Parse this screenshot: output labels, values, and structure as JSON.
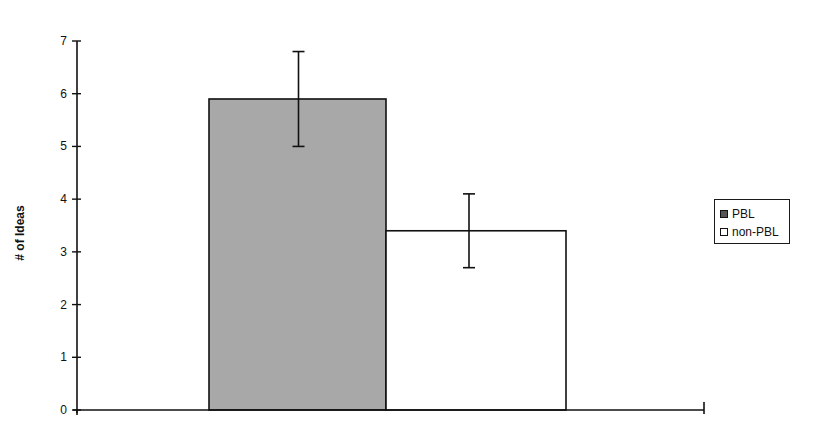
{
  "chart_data": {
    "type": "bar",
    "title": "",
    "xlabel": "",
    "ylabel": "# of Ideas",
    "ylim": [
      0,
      7
    ],
    "yticks": [
      0,
      1,
      2,
      3,
      4,
      5,
      6,
      7
    ],
    "grid": false,
    "legend_position": "right",
    "categories": [
      ""
    ],
    "series": [
      {
        "name": "PBL",
        "values": [
          5.9
        ],
        "error": [
          0.9
        ],
        "color": "#a8a8a8"
      },
      {
        "name": "non-PBL",
        "values": [
          3.4
        ],
        "error": [
          0.7
        ],
        "color": "#ffffff"
      }
    ]
  },
  "legend": {
    "items": [
      {
        "label": "PBL"
      },
      {
        "label": "non-PBL"
      }
    ]
  },
  "axis": {
    "ylabel": "# of Ideas"
  }
}
